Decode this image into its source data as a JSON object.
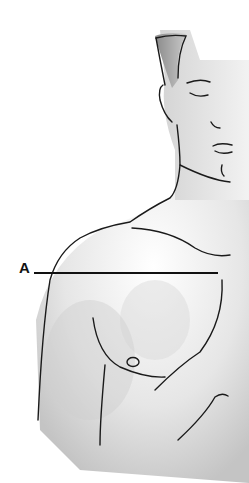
{
  "figure": {
    "labels": [
      {
        "id": "A",
        "text": "A",
        "points_to": "upper chest / shoulder level horizontal line"
      }
    ]
  },
  "colors": {
    "line": "#1a1a1a",
    "skin_shade": "#c8c8c8",
    "background": "#ffffff"
  }
}
